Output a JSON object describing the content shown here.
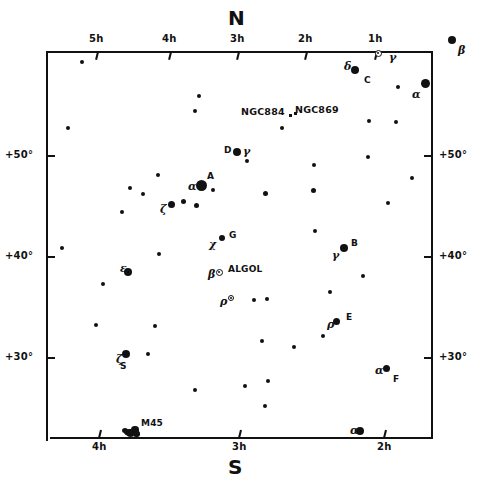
{
  "chart_data": {
    "type": "scatter",
    "xlabel": "Right Ascension (hours)",
    "ylabel": "Declination (degrees)",
    "grid": false,
    "legend": "none",
    "cardinal_top": "N",
    "cardinal_bottom": "S",
    "ra_ticks_top": [
      {
        "label": "5h",
        "x": 97
      },
      {
        "label": "4h",
        "x": 170
      },
      {
        "label": "3h",
        "x": 238
      },
      {
        "label": "2h",
        "x": 306
      },
      {
        "label": "1h",
        "x": 376
      }
    ],
    "ra_ticks_bottom": [
      {
        "label": "4h",
        "x": 100
      },
      {
        "label": "3h",
        "x": 240
      },
      {
        "label": "2h",
        "x": 385
      }
    ],
    "dec_ticks": [
      {
        "label": "+50°",
        "y": 155
      },
      {
        "label": "+40°",
        "y": 256
      },
      {
        "label": "+30°",
        "y": 357
      }
    ],
    "dec_ticks_right": [
      {
        "label": "+50°",
        "y": 155
      },
      {
        "label": "+40°",
        "y": 256
      },
      {
        "label": "+30°",
        "y": 357
      }
    ],
    "axis_ranges": {
      "ra": [
        5.4,
        0.7
      ],
      "dec": [
        24,
        56
      ]
    },
    "named_stars": [
      {
        "greek": "α",
        "letter": "A",
        "name": "Mirfak",
        "x": 201,
        "y": 185,
        "size": 11,
        "kind": "filled"
      },
      {
        "greek": "β",
        "letter": "",
        "name": "Algol",
        "x": 219,
        "y": 272,
        "size": 7,
        "kind": "open"
      },
      {
        "greek": "γ",
        "letter": "",
        "name": "gamma Per",
        "x": 378,
        "y": 53,
        "size": 7,
        "kind": "open"
      },
      {
        "greek": "δ",
        "letter": "C",
        "name": "delta Per",
        "x": 355,
        "y": 70,
        "size": 8,
        "kind": "filled"
      },
      {
        "greek": "γ",
        "letter": "B",
        "name": "gamma And",
        "x": 344,
        "y": 248,
        "size": 8,
        "kind": "filled"
      },
      {
        "greek": "γ",
        "letter": "",
        "name": "gamma Per D",
        "x": 237,
        "y": 152,
        "size": 8,
        "kind": "filled"
      },
      {
        "greek": "ε",
        "letter": "",
        "name": "epsilon Per",
        "x": 128,
        "y": 272,
        "size": 8,
        "kind": "filled"
      },
      {
        "greek": "ζ",
        "letter": "",
        "name": "zeta Per",
        "x": 171,
        "y": 204,
        "size": 7,
        "kind": "filled"
      },
      {
        "greek": "ζ",
        "letter": "S",
        "name": "zeta Tau",
        "x": 126,
        "y": 354,
        "size": 8,
        "kind": "filled"
      },
      {
        "greek": "ρ",
        "letter": "",
        "name": "rho Per",
        "x": 231,
        "y": 298,
        "size": 6,
        "kind": "open"
      },
      {
        "greek": "ρ",
        "letter": "E",
        "name": "rho And",
        "x": 336,
        "y": 321,
        "size": 7,
        "kind": "filled"
      },
      {
        "greek": "α",
        "letter": "F",
        "name": "alpha Tri",
        "x": 386,
        "y": 368,
        "size": 7,
        "kind": "filled"
      },
      {
        "greek": "α",
        "letter": "",
        "name": "alpha Ari",
        "x": 360,
        "y": 431,
        "size": 8,
        "kind": "filled"
      },
      {
        "greek": "α",
        "letter": "",
        "name": "alpha And",
        "x": 425,
        "y": 83,
        "size": 9,
        "kind": "filled"
      },
      {
        "greek": "β",
        "letter": "",
        "name": "beta Cas",
        "x": 452,
        "y": 40,
        "size": 8,
        "kind": "filled"
      },
      {
        "greek": "χ",
        "letter": "G",
        "name": "chi Per",
        "x": 222,
        "y": 238,
        "size": 6,
        "kind": "filled"
      }
    ],
    "star_labels": [
      {
        "text": "A",
        "x": 207,
        "y": 171
      },
      {
        "text": "C",
        "x": 364,
        "y": 75
      },
      {
        "text": "B",
        "x": 351,
        "y": 238
      },
      {
        "text": "D",
        "x": 224,
        "y": 145
      },
      {
        "text": "E",
        "x": 346,
        "y": 312
      },
      {
        "text": "F",
        "x": 393,
        "y": 374
      },
      {
        "text": "G",
        "x": 229,
        "y": 230
      },
      {
        "text": "S",
        "x": 120,
        "y": 361
      },
      {
        "text": "ALGOL",
        "x": 228,
        "y": 264
      },
      {
        "text": "M45",
        "x": 141,
        "y": 418
      }
    ],
    "greek_labels": [
      {
        "text": "α",
        "x": 188,
        "y": 180
      },
      {
        "text": "β",
        "x": 208,
        "y": 268
      },
      {
        "text": "γ",
        "x": 389,
        "y": 51
      },
      {
        "text": "δ",
        "x": 344,
        "y": 60
      },
      {
        "text": "γ",
        "x": 243,
        "y": 145
      },
      {
        "text": "γ",
        "x": 332,
        "y": 249
      },
      {
        "text": "ε",
        "x": 120,
        "y": 262
      },
      {
        "text": "ζ",
        "x": 160,
        "y": 203
      },
      {
        "text": "ζ",
        "x": 116,
        "y": 353
      },
      {
        "text": "ρ",
        "x": 220,
        "y": 295
      },
      {
        "text": "ρ",
        "x": 327,
        "y": 318
      },
      {
        "text": "α",
        "x": 375,
        "y": 364
      },
      {
        "text": "α",
        "x": 350,
        "y": 424
      },
      {
        "text": "α",
        "x": 412,
        "y": 88
      },
      {
        "text": "β",
        "x": 458,
        "y": 44
      },
      {
        "text": "χ",
        "x": 209,
        "y": 238
      }
    ],
    "deep_sky_objects": [
      {
        "label": "NGC884",
        "label_x": 241,
        "label_y": 106,
        "marker_x": 289,
        "marker_y": 114
      },
      {
        "label": "NGC869",
        "label_x": 295,
        "label_y": 104,
        "marker_x": 294,
        "marker_y": 112
      },
      {
        "label": "M45",
        "label_x": 141,
        "label_y": 418,
        "marker_x": 130,
        "marker_y": 431
      }
    ],
    "field_stars": [
      {
        "x": 82,
        "y": 62,
        "size": 4
      },
      {
        "x": 68,
        "y": 128,
        "size": 4
      },
      {
        "x": 199,
        "y": 96,
        "size": 4
      },
      {
        "x": 195,
        "y": 111,
        "size": 4
      },
      {
        "x": 247,
        "y": 161,
        "size": 4
      },
      {
        "x": 314,
        "y": 165,
        "size": 4
      },
      {
        "x": 368,
        "y": 157,
        "size": 4
      },
      {
        "x": 398,
        "y": 87,
        "size": 4
      },
      {
        "x": 396,
        "y": 122,
        "size": 4
      },
      {
        "x": 412,
        "y": 178,
        "size": 4
      },
      {
        "x": 388,
        "y": 203,
        "size": 4
      },
      {
        "x": 313,
        "y": 190,
        "size": 5
      },
      {
        "x": 265,
        "y": 193,
        "size": 5
      },
      {
        "x": 213,
        "y": 190,
        "size": 4
      },
      {
        "x": 183,
        "y": 201,
        "size": 5
      },
      {
        "x": 196,
        "y": 205,
        "size": 5
      },
      {
        "x": 143,
        "y": 194,
        "size": 4
      },
      {
        "x": 130,
        "y": 188,
        "size": 4
      },
      {
        "x": 158,
        "y": 175,
        "size": 4
      },
      {
        "x": 122,
        "y": 212,
        "size": 4
      },
      {
        "x": 159,
        "y": 254,
        "size": 4
      },
      {
        "x": 62,
        "y": 248,
        "size": 4
      },
      {
        "x": 155,
        "y": 326,
        "size": 4
      },
      {
        "x": 148,
        "y": 354,
        "size": 4
      },
      {
        "x": 96,
        "y": 325,
        "size": 4
      },
      {
        "x": 195,
        "y": 390,
        "size": 4
      },
      {
        "x": 245,
        "y": 386,
        "size": 4
      },
      {
        "x": 268,
        "y": 381,
        "size": 4
      },
      {
        "x": 254,
        "y": 300,
        "size": 4
      },
      {
        "x": 262,
        "y": 341,
        "size": 4
      },
      {
        "x": 267,
        "y": 299,
        "size": 4
      },
      {
        "x": 323,
        "y": 336,
        "size": 4
      },
      {
        "x": 294,
        "y": 347,
        "size": 4
      },
      {
        "x": 265,
        "y": 406,
        "size": 4
      },
      {
        "x": 363,
        "y": 276,
        "size": 4
      },
      {
        "x": 330,
        "y": 292,
        "size": 4
      },
      {
        "x": 369,
        "y": 121,
        "size": 4
      },
      {
        "x": 282,
        "y": 128,
        "size": 4
      },
      {
        "x": 315,
        "y": 231,
        "size": 4
      },
      {
        "x": 103,
        "y": 284,
        "size": 4
      }
    ]
  }
}
